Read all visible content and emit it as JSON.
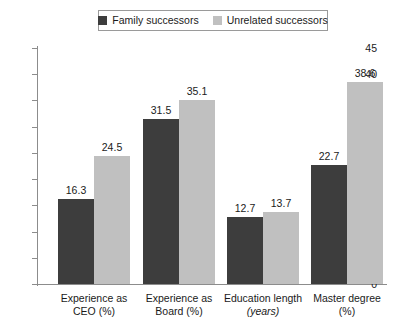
{
  "chart_data": {
    "type": "bar",
    "title": "",
    "xlabel": "",
    "ylabel": "",
    "ylim": [
      0,
      45
    ],
    "yticks": [
      0,
      5,
      10,
      15,
      20,
      25,
      30,
      35,
      40,
      45
    ],
    "grid": false,
    "legend_position": "top",
    "categories": [
      "Experience as CEO (%)",
      "Experience as Board (%)",
      "Education length (years)",
      "Master degree (%)"
    ],
    "category_lines": [
      [
        "Experience as",
        "CEO (%)"
      ],
      [
        "Experience as",
        "Board (%)"
      ],
      [
        "Education length",
        "(years)"
      ],
      [
        "Master degree",
        "(%)"
      ]
    ],
    "category_italic_second_line": [
      false,
      false,
      true,
      false
    ],
    "series": [
      {
        "name": "Family successors",
        "color": "#3d3d3d",
        "values": [
          16.3,
          31.5,
          12.7,
          22.7
        ]
      },
      {
        "name": "Unrelated successors",
        "color": "#c0c0c0",
        "values": [
          24.5,
          35.1,
          13.7,
          38.6
        ]
      }
    ]
  },
  "legend": {
    "entries": [
      {
        "label": "Family successors",
        "color": "#3d3d3d"
      },
      {
        "label": "Unrelated successors",
        "color": "#c0c0c0"
      }
    ]
  },
  "axis": {
    "tick_labels": [
      "45",
      "40",
      "35",
      "30",
      "25",
      "20",
      "15",
      "10",
      "5",
      "0"
    ],
    "line_color": "#8c8c8c"
  }
}
